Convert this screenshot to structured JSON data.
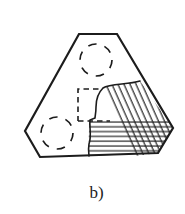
{
  "figure": {
    "label": "b)"
  },
  "colors": {
    "background": "#ffffff",
    "ink": "#1c1c1c"
  },
  "diagram": {
    "viewbox": "0 0 185 214",
    "outline": {
      "points": "79,34 117,34 173,128 158,153 40,157 25,131",
      "stroke_width": 2.2
    },
    "dashed_circles": [
      {
        "name": "top-hole",
        "cx": 96,
        "cy": 60,
        "r": 16
      },
      {
        "name": "bottom-left-hole",
        "cx": 57,
        "cy": 133,
        "r": 16
      }
    ],
    "dashed_square": {
      "under_path": "M108,89 L78,89 L78,121",
      "over_path": "M78,121 L110,121",
      "dash": "5.5 4",
      "stroke_width": 1.6
    },
    "section_region": {
      "fill_path": "M140,81 C128,85 110,83 103,88 C98,93 96,99 96,107 C96,113 95,116 95,118 L90,120 C89,127 92,135 89,144 C88,150 89,154 89,156 L158,153 L173,128 Z",
      "boundary_path": "M140,81 C128,85 110,83 103,88 C98,93 96,99 96,107 C96,113 95,116 95,118 L90,120 C89,127 92,135 89,144 C88,150 89,154 89,156",
      "diagonal_path": "M140,81 C128,85 110,83 103,88 L135,156 L158,153 L173,128 Z",
      "horizontal_path": "M90,120 L168,120 L173,128 L158,153 L89,156 C89,150 88,134 90,120 Z",
      "diagonal_spacing": 5.5,
      "diagonal_angle": -24,
      "horizontal_spacing": 4.8,
      "hatch_stroke_width": 1.15,
      "boundary_stroke_width": 1.6
    }
  }
}
